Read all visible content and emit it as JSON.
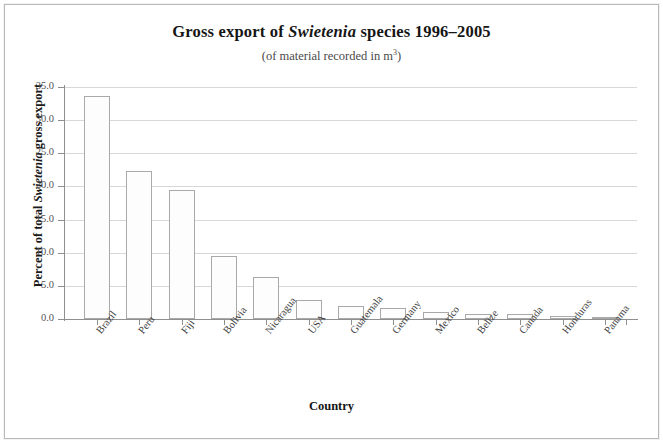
{
  "chart_data": {
    "type": "bar",
    "title": "Gross export of Swietenia species 1996–2005",
    "title_parts": {
      "before": "Gross export of ",
      "italic": "Swietenia",
      "after": " species 1996–2005"
    },
    "subtitle": "(of material recorded in m³)",
    "subtitle_parts": {
      "before": "(of material recorded in m",
      "superscript": "3",
      "after": ")"
    },
    "xlabel": "Country",
    "ylabel": "Percent of total Swietenia gross export",
    "ylabel_parts": {
      "before": "Percent of total ",
      "italic": "Swietenia",
      "after": " gross export"
    },
    "categories": [
      "Brazil",
      "Peru",
      "Fiji",
      "Bolivia",
      "Nicaragua",
      "USA",
      "Guatemala",
      "Germany",
      "Mexico",
      "Belize",
      "Canada",
      "Honduras",
      "Panama"
    ],
    "values": [
      33.6,
      22.3,
      19.5,
      9.5,
      6.4,
      2.8,
      1.9,
      1.6,
      1.0,
      0.8,
      0.8,
      0.4,
      0.3
    ],
    "ylim": [
      0.0,
      35.0
    ],
    "ytick_values": [
      0.0,
      5.0,
      10.0,
      15.0,
      20.0,
      25.0,
      30.0,
      35.0
    ],
    "ytick_labels": [
      "0.0",
      "5.0",
      "10.0",
      "15.0",
      "20.0",
      "25.0",
      "30.0",
      "35.0"
    ],
    "grid": true,
    "legend": null,
    "bar_fill_color": "#fdfdfd",
    "bar_border_color": "#a9a9a9",
    "grid_color": "#d8d8d8",
    "axis_color": "#8f8f8f"
  }
}
